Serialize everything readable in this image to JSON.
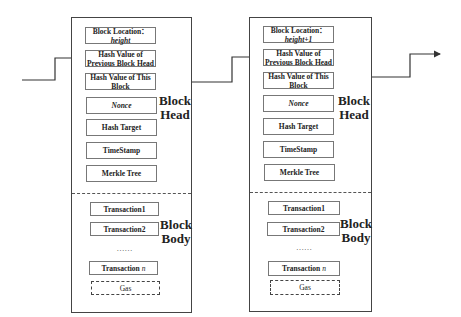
{
  "blocks": [
    {
      "id": "block-1",
      "head_label": [
        "Block",
        "Head"
      ],
      "body_label": [
        "Block",
        "Body"
      ],
      "head_fields": [
        {
          "line1": "Block Location：",
          "line2": "height",
          "line2_italic": true
        },
        {
          "line1": "Hash Value of",
          "line2": "Previous Block Head"
        },
        {
          "line1": "Hash Value of This",
          "line2": "Block"
        },
        {
          "line1": "Nonce",
          "italic": true
        },
        {
          "line1": "Hash Target"
        },
        {
          "line1": "TimeStamp"
        },
        {
          "line1": "Merkle Tree"
        }
      ],
      "body_fields": [
        {
          "label": "Transaction1"
        },
        {
          "label": "Transaction2"
        },
        {
          "label": "……"
        },
        {
          "label": "Transaction ",
          "suffix": "n"
        },
        {
          "label": "Gas"
        }
      ]
    },
    {
      "id": "block-2",
      "head_label": [
        "Block",
        "Head"
      ],
      "body_label": [
        "Block",
        "Body"
      ],
      "head_fields": [
        {
          "line1": "Block Location：",
          "line2": "height+1",
          "line2_italic": true
        },
        {
          "line1": "Hash Value of",
          "line2": "Previous Block Head"
        },
        {
          "line1": "Hash Value of This",
          "line2": "Block"
        },
        {
          "line1": "Nonce",
          "italic": true
        },
        {
          "line1": "Hash Target"
        },
        {
          "line1": "TimeStamp"
        },
        {
          "line1": "Merkle Tree"
        }
      ],
      "body_fields": [
        {
          "label": "Transaction1"
        },
        {
          "label": "Transaction2"
        },
        {
          "label": "……"
        },
        {
          "label": "Transaction ",
          "suffix": "n"
        },
        {
          "label": "Gas"
        }
      ]
    }
  ],
  "colors": {
    "line": "#444444",
    "box_border": "#777777",
    "text": "#222222"
  }
}
